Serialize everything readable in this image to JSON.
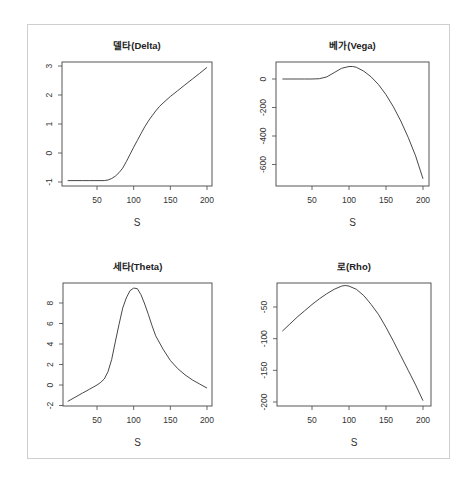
{
  "chart_data": [
    {
      "type": "line",
      "title": "델타(Delta)",
      "xlabel": "S",
      "ylabel": "",
      "xlim": [
        10,
        200
      ],
      "ylim": [
        -1,
        3
      ],
      "xticks": [
        50,
        100,
        150,
        200
      ],
      "yticks": [
        -1,
        0,
        1,
        2,
        3
      ],
      "grid": false,
      "x": [
        10,
        20,
        30,
        40,
        50,
        60,
        65,
        70,
        75,
        80,
        85,
        90,
        95,
        100,
        105,
        110,
        115,
        120,
        125,
        130,
        135,
        140,
        150,
        160,
        170,
        180,
        190,
        200
      ],
      "values": [
        -0.95,
        -0.95,
        -0.95,
        -0.95,
        -0.95,
        -0.95,
        -0.93,
        -0.88,
        -0.8,
        -0.68,
        -0.52,
        -0.3,
        -0.05,
        0.2,
        0.43,
        0.67,
        0.9,
        1.1,
        1.28,
        1.45,
        1.6,
        1.72,
        1.95,
        2.15,
        2.35,
        2.55,
        2.75,
        2.95
      ],
      "panel": {
        "left": 62,
        "top": 62,
        "right": 212,
        "bottom": 186,
        "x0": 97,
        "xs": 0.7333,
        "y0v": 0,
        "y0p": 153,
        "ys": 29
      }
    },
    {
      "type": "line",
      "title": "베가(Vega)",
      "xlabel": "S",
      "ylabel": "",
      "xlim": [
        10,
        200
      ],
      "ylim": [
        -700,
        90
      ],
      "xticks": [
        50,
        100,
        150,
        200
      ],
      "yticks": [
        0,
        -200,
        -400,
        -600
      ],
      "grid": false,
      "x": [
        10,
        20,
        30,
        40,
        50,
        60,
        70,
        80,
        90,
        100,
        105,
        110,
        120,
        130,
        140,
        150,
        160,
        170,
        180,
        190,
        200
      ],
      "values": [
        0,
        0,
        0,
        0,
        0,
        2,
        15,
        45,
        75,
        88,
        88,
        82,
        55,
        15,
        -40,
        -110,
        -195,
        -295,
        -410,
        -540,
        -700
      ],
      "panel": {
        "left": 276,
        "top": 62,
        "right": 429,
        "bottom": 186,
        "x0": 312,
        "xs": 0.74,
        "y0v": 0,
        "y0p": 79,
        "ys": 0.1425
      }
    },
    {
      "type": "line",
      "title": "세타(Theta)",
      "xlabel": "S",
      "ylabel": "",
      "xlim": [
        10,
        200
      ],
      "ylim": [
        -2,
        9.5
      ],
      "xticks": [
        50,
        100,
        150,
        200
      ],
      "yticks": [
        -2,
        0,
        2,
        4,
        6,
        8
      ],
      "grid": false,
      "x": [
        10,
        20,
        30,
        40,
        50,
        55,
        60,
        65,
        70,
        75,
        80,
        85,
        90,
        95,
        100,
        105,
        110,
        115,
        120,
        125,
        130,
        140,
        150,
        160,
        170,
        180,
        190,
        200
      ],
      "values": [
        -1.6,
        -1.2,
        -0.8,
        -0.4,
        0.0,
        0.25,
        0.6,
        1.3,
        2.5,
        4.2,
        5.9,
        7.5,
        8.5,
        9.2,
        9.45,
        9.4,
        8.8,
        7.9,
        6.9,
        5.8,
        4.8,
        3.5,
        2.4,
        1.6,
        1.0,
        0.5,
        0.1,
        -0.3
      ],
      "panel": {
        "left": 63,
        "top": 283,
        "right": 212,
        "bottom": 406,
        "x0": 97,
        "xs": 0.7333,
        "y0v": 0,
        "y0p": 385,
        "ys": 10.25
      }
    },
    {
      "type": "line",
      "title": "로(Rho)",
      "xlabel": "S",
      "ylabel": "",
      "xlim": [
        10,
        200
      ],
      "ylim": [
        -200,
        -15
      ],
      "xticks": [
        50,
        100,
        150,
        200
      ],
      "yticks": [
        -50,
        -100,
        -150,
        -200
      ],
      "grid": false,
      "x": [
        10,
        20,
        30,
        40,
        50,
        60,
        70,
        80,
        90,
        95,
        100,
        110,
        120,
        130,
        140,
        150,
        160,
        170,
        180,
        190,
        200
      ],
      "values": [
        -88,
        -77,
        -66,
        -56,
        -46,
        -37,
        -29,
        -22,
        -17,
        -16,
        -17,
        -22,
        -32,
        -46,
        -62,
        -82,
        -104,
        -127,
        -150,
        -173,
        -198
      ],
      "panel": {
        "left": 277,
        "top": 283,
        "right": 431,
        "bottom": 406,
        "x0": 312,
        "xs": 0.74,
        "y0v": -50,
        "y0p": 307,
        "ys": 0.6333
      }
    }
  ]
}
